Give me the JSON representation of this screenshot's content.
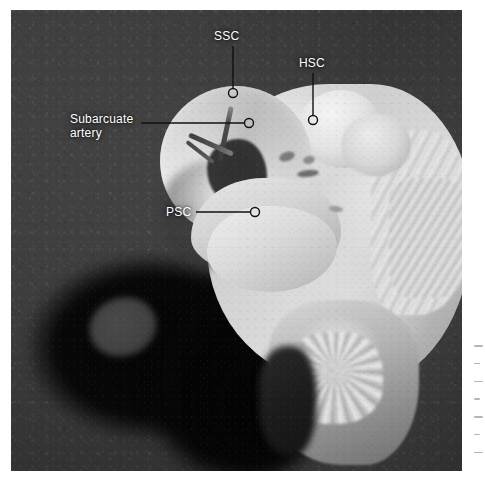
{
  "figure": {
    "type": "anatomical-specimen-photograph",
    "background_color": "#3a3a3a",
    "specimen_color": "#d8d8d8",
    "annotation_color": "#ffffff",
    "leader_line_color": "#111111",
    "marker_shape": "open-circle"
  },
  "labels": [
    {
      "id": "ssc",
      "text": "SSC",
      "meaning": "superior semicircular canal",
      "text_x": 214,
      "text_y": 30,
      "line": {
        "x1": 233,
        "y1": 46,
        "x2": 233,
        "y2": 88
      },
      "marker": {
        "cx": 233,
        "cy": 93,
        "r": 4.5
      },
      "orientation": "vertical"
    },
    {
      "id": "hsc",
      "text": "HSC",
      "meaning": "horizontal semicircular canal",
      "text_x": 299,
      "text_y": 57,
      "line": {
        "x1": 313,
        "y1": 73,
        "x2": 313,
        "y2": 115
      },
      "marker": {
        "cx": 313,
        "cy": 120,
        "r": 4.5
      },
      "orientation": "vertical"
    },
    {
      "id": "subarcuate-artery",
      "text": "Subarcuate\nartery",
      "line1": "Subarcuate",
      "line2": "artery",
      "meaning": "subarcuate artery",
      "text_x": 70,
      "text_y": 113,
      "line": {
        "x1": 141,
        "y1": 123,
        "x2": 244,
        "y2": 123
      },
      "marker": {
        "cx": 249,
        "cy": 123,
        "r": 4.5
      },
      "orientation": "horizontal"
    },
    {
      "id": "psc",
      "text": "PSC",
      "meaning": "posterior semicircular canal",
      "text_x": 166,
      "text_y": 206,
      "line": {
        "x1": 196,
        "y1": 212,
        "x2": 250,
        "y2": 212
      },
      "marker": {
        "cx": 255,
        "cy": 212,
        "r": 4.5
      },
      "orientation": "horizontal"
    }
  ],
  "margin_note": {
    "visible": true,
    "legible": false,
    "description": "faint partially-cropped vertical caption text at right page edge"
  }
}
